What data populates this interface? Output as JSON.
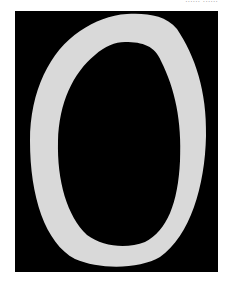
{
  "caption": {
    "text": "...... ......"
  },
  "image": {
    "description": "Light gray irregular oval ring on black background",
    "background_color": "#000000",
    "ring_color": "#d9d9d9"
  }
}
